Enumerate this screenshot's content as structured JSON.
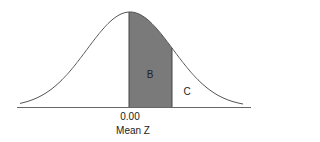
{
  "diagram": {
    "type": "normal-distribution-curve",
    "regions": [
      {
        "label": "B",
        "description": "shaded area between mean and z",
        "fill": "#7a7a7a"
      },
      {
        "label": "C",
        "description": "unshaded tail area beyond z"
      }
    ],
    "x_tick_label": "0.00",
    "x_axis_label": "Mean Z",
    "colors": {
      "curve": "#555555",
      "shade": "#7a7a7a",
      "axis": "#666666"
    }
  }
}
